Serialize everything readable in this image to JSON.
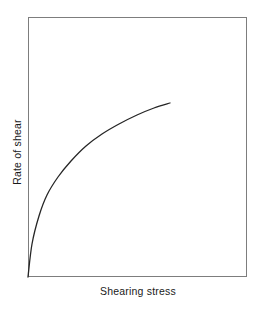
{
  "figure": {
    "background_color": "#ffffff",
    "width": 264,
    "height": 310
  },
  "chart_data": {
    "type": "line",
    "title": "",
    "subtitle": "",
    "xlabel": "Shearing stress",
    "ylabel": "Rate of shear",
    "grid": false,
    "legend": false,
    "legend_position": "none",
    "xticks": [],
    "yticks": [],
    "xticklabels": [],
    "yticklabels": [],
    "xlim": [
      0,
      100
    ],
    "ylim": [
      0,
      100
    ],
    "axis_frame": {
      "visible": true,
      "color": "#7d7d7d",
      "linewidth": 1,
      "top": true,
      "right": true,
      "bottom": true,
      "left": true
    },
    "series": [
      {
        "name": "Pseudoplastic flow",
        "color": "#262626",
        "linewidth": 1.3,
        "x": [
          0,
          2,
          5,
          9,
          14,
          20,
          27,
          34,
          42,
          50,
          58,
          65,
          65
        ],
        "y": [
          0,
          17,
          34,
          48,
          58,
          66,
          73,
          79,
          83,
          87,
          90,
          92,
          92
        ],
        "x_pixels": [
          28,
          32,
          39,
          47,
          58,
          71,
          86,
          102,
          119,
          137,
          154,
          170
        ],
        "y_pixels": [
          277,
          244,
          216,
          195,
          177,
          161,
          146,
          134,
          124,
          115,
          108,
          103
        ]
      }
    ]
  },
  "labels": {
    "xlabel": "Shearing stress",
    "ylabel": "Rate of shear"
  }
}
